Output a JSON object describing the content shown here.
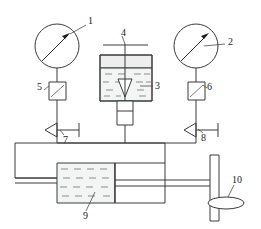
{
  "diagram": {
    "stroke_color": "#3a3a3a",
    "liquid_color": "#f3f4f4",
    "air_color": "#eeeeee",
    "background": "#ffffff"
  },
  "labels": [
    {
      "id": "1",
      "text": "1",
      "name": "callout-1-pressure-gauge-left",
      "x": 88,
      "y": 24
    },
    {
      "id": "2",
      "text": "2",
      "name": "callout-2-pressure-gauge-right",
      "x": 228,
      "y": 45
    },
    {
      "id": "3",
      "text": "3",
      "name": "callout-3-liquid-tank",
      "x": 155,
      "y": 88
    },
    {
      "id": "4",
      "text": "4",
      "name": "callout-4-actuator-rod",
      "x": 124,
      "y": 39
    },
    {
      "id": "5",
      "text": "5",
      "name": "callout-5-left-transducer",
      "x": 36,
      "y": 91
    },
    {
      "id": "6",
      "text": "6",
      "name": "callout-6-right-transducer",
      "x": 207,
      "y": 91
    },
    {
      "id": "7",
      "text": "7",
      "name": "callout-7-left-valve",
      "x": 65,
      "y": 137
    },
    {
      "id": "8",
      "text": "8",
      "name": "callout-8-right-valve",
      "x": 206,
      "y": 135
    },
    {
      "id": "9",
      "text": "9",
      "name": "callout-9-cylinder-chamber",
      "x": 87,
      "y": 216
    },
    {
      "id": "10",
      "text": "10",
      "name": "callout-10-load-disc",
      "x": 235,
      "y": 182
    }
  ],
  "components": {
    "gauge_left": {
      "name": "pressure-gauge-left",
      "cx": 57,
      "cy": 46,
      "r": 22
    },
    "gauge_right": {
      "name": "pressure-gauge-right",
      "cx": 196,
      "cy": 46,
      "r": 22
    },
    "transducer_left": {
      "name": "transducer-box-left",
      "x": 49,
      "y": 82,
      "w": 17,
      "h": 18
    },
    "transducer_right": {
      "name": "transducer-box-right",
      "x": 188,
      "y": 82,
      "w": 17,
      "h": 18
    },
    "valve_left": {
      "name": "shutoff-valve-left",
      "x": 57,
      "y": 123
    },
    "valve_right": {
      "name": "shutoff-valve-right",
      "x": 196,
      "y": 123
    },
    "tank": {
      "name": "liquid-tank",
      "x": 100,
      "y": 55,
      "w": 52,
      "h": 46,
      "liquid_top": 68
    },
    "tank_stem": {
      "name": "tank-outlet-body",
      "x": 117,
      "y": 101,
      "w": 16,
      "h": 24
    },
    "rod": {
      "name": "actuator-rod",
      "x": 125,
      "top": 44,
      "bottom": 104
    },
    "handle_bar": {
      "name": "rod-handle-bar",
      "x1": 103,
      "x2": 148,
      "y": 45
    },
    "manifold": {
      "name": "pressure-manifold-line",
      "y": 143,
      "x1": 57,
      "x2": 196
    },
    "reservoir_box": {
      "name": "reservoir-box",
      "x": 15,
      "y": 146,
      "w": 150,
      "h": 32
    },
    "cylinder": {
      "name": "hydraulic-cylinder",
      "x": 57,
      "y": 163,
      "w": 108,
      "h": 40
    },
    "piston": {
      "name": "piston-face",
      "x": 115
    },
    "piston_rod": {
      "name": "piston-rod",
      "x1": 115,
      "x2": 210,
      "y": 183
    },
    "plate": {
      "name": "load-plate",
      "x": 210,
      "y": 155,
      "w": 9,
      "h": 66
    },
    "disc": {
      "name": "load-disc",
      "cx": 226,
      "cy": 203,
      "rx": 18,
      "ry": 6
    }
  }
}
